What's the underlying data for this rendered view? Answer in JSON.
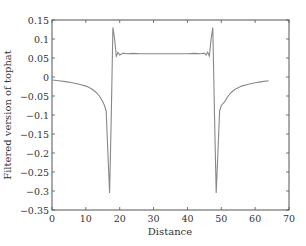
{
  "chart_data": {
    "type": "line",
    "title": "",
    "xlabel": "Distance",
    "ylabel": "Filtered version of tophat",
    "xlim": [
      0,
      70
    ],
    "ylim": [
      -0.35,
      0.15
    ],
    "xticks": [
      0,
      10,
      20,
      30,
      40,
      50,
      60,
      70
    ],
    "yticks": [
      0.15,
      0.1,
      0.05,
      0,
      -0.05,
      -0.1,
      -0.15,
      -0.2,
      -0.25,
      -0.3,
      -0.35
    ],
    "xtick_labels": [
      "0",
      "10",
      "20",
      "30",
      "40",
      "50",
      "60",
      "70"
    ],
    "ytick_labels": [
      "0.15",
      "0.1",
      "0.05",
      "0",
      "−0.05",
      "−0.1",
      "−0.15",
      "−0.2",
      "−0.25",
      "−0.3",
      "−0.35"
    ],
    "grid": false,
    "legend": null,
    "line_color": "#888888",
    "series": [
      {
        "name": "filtered tophat",
        "x": [
          0,
          2,
          4,
          6,
          8,
          10,
          11,
          12,
          13,
          14,
          15,
          15.5,
          16,
          16.5,
          17,
          17.5,
          18,
          18.5,
          19,
          19.5,
          20,
          21,
          22,
          24,
          26,
          28,
          30,
          32,
          34,
          36,
          38,
          40,
          42,
          44,
          45,
          45.5,
          46,
          46.5,
          47,
          47.5,
          48,
          48.5,
          49,
          49.5,
          50,
          51,
          52,
          53,
          54,
          56,
          58,
          60,
          62,
          64
        ],
        "y": [
          -0.008,
          -0.01,
          -0.012,
          -0.015,
          -0.019,
          -0.024,
          -0.028,
          -0.033,
          -0.04,
          -0.05,
          -0.065,
          -0.075,
          -0.09,
          -0.2,
          -0.305,
          -0.1,
          0.13,
          0.1,
          0.055,
          0.065,
          0.058,
          0.063,
          0.061,
          0.062,
          0.061,
          0.061,
          0.061,
          0.061,
          0.061,
          0.061,
          0.061,
          0.061,
          0.062,
          0.061,
          0.063,
          0.058,
          0.065,
          0.055,
          0.1,
          0.13,
          -0.1,
          -0.305,
          -0.2,
          -0.09,
          -0.075,
          -0.065,
          -0.05,
          -0.04,
          -0.033,
          -0.024,
          -0.019,
          -0.015,
          -0.012,
          -0.01
        ]
      }
    ]
  }
}
